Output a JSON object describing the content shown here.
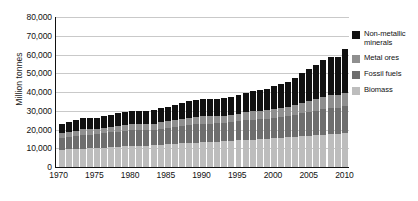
{
  "chart_data": {
    "type": "bar",
    "stacked": true,
    "title": "",
    "xlabel": "",
    "ylabel": "Million tonnes",
    "ylim": [
      0,
      80000
    ],
    "ytick_labels": [
      "80,000",
      "70,000",
      "60,000",
      "50,000",
      "40,000",
      "30,000",
      "20,000",
      "10,000",
      "0"
    ],
    "ytick_values": [
      80000,
      70000,
      60000,
      50000,
      40000,
      30000,
      20000,
      10000,
      0
    ],
    "xtick_labels": [
      "1970",
      "1975",
      "1980",
      "1985",
      "1990",
      "1995",
      "2000",
      "2005",
      "2010"
    ],
    "xtick_values": [
      1970,
      1975,
      1980,
      1985,
      1990,
      1995,
      2000,
      2005,
      2010
    ],
    "grid": true,
    "legend_position": "right",
    "x": [
      1970,
      1971,
      1972,
      1973,
      1974,
      1975,
      1976,
      1977,
      1978,
      1979,
      1980,
      1981,
      1982,
      1983,
      1984,
      1985,
      1986,
      1987,
      1988,
      1989,
      1990,
      1991,
      1992,
      1993,
      1994,
      1995,
      1996,
      1997,
      1998,
      1999,
      2000,
      2001,
      2002,
      2003,
      2004,
      2005,
      2006,
      2007,
      2008,
      2009,
      2010
    ],
    "series": [
      {
        "name": "Biomass",
        "color": "#bdbdbd",
        "values": [
          9200,
          9400,
          9550,
          9800,
          9900,
          10050,
          10300,
          10500,
          10750,
          10950,
          11100,
          11250,
          11450,
          11650,
          11900,
          12100,
          12350,
          12550,
          12800,
          13000,
          13200,
          13300,
          13500,
          13700,
          13950,
          14200,
          14450,
          14650,
          14850,
          15050,
          15300,
          15500,
          15750,
          16000,
          16300,
          16600,
          16900,
          17200,
          17500,
          17700,
          18000
        ]
      },
      {
        "name": "Fossil fuels",
        "color": "#6e6e6e",
        "values": [
          6400,
          6700,
          7000,
          7400,
          7400,
          7300,
          7700,
          7950,
          8150,
          8400,
          8400,
          8250,
          8200,
          8250,
          8600,
          8900,
          9100,
          9350,
          9650,
          9850,
          9900,
          9900,
          9850,
          9850,
          9950,
          10150,
          10450,
          10600,
          10700,
          10800,
          11100,
          11250,
          11400,
          11900,
          12400,
          12800,
          13200,
          13650,
          13950,
          13700,
          14300
        ]
      },
      {
        "name": "Metal ores",
        "color": "#8f8f8f",
        "values": [
          2600,
          2700,
          2800,
          2950,
          2950,
          2850,
          3000,
          3100,
          3150,
          3250,
          3250,
          3200,
          3150,
          3200,
          3350,
          3450,
          3550,
          3650,
          3800,
          3900,
          3950,
          3900,
          3850,
          3850,
          3950,
          4100,
          4250,
          4400,
          4450,
          4550,
          4750,
          4850,
          5000,
          5350,
          5700,
          6000,
          6350,
          6700,
          6950,
          6800,
          7400
        ]
      },
      {
        "name": "Non-metallic minerals",
        "color": "#111111",
        "values": [
          5000,
          5200,
          5500,
          5900,
          5850,
          5800,
          6150,
          6450,
          6700,
          6950,
          7000,
          6950,
          6900,
          7050,
          7450,
          7750,
          8100,
          8500,
          8900,
          9150,
          9250,
          9150,
          9100,
          9200,
          9500,
          9900,
          10350,
          10750,
          11000,
          11400,
          12000,
          12500,
          13200,
          14400,
          15700,
          16900,
          18200,
          19500,
          20300,
          20600,
          23000
        ]
      }
    ],
    "totals": [
      23200,
      24000,
      24850,
      26050,
      26100,
      26000,
      27150,
      28000,
      28750,
      29550,
      29750,
      29650,
      29700,
      30150,
      31300,
      32200,
      33100,
      34050,
      35150,
      35900,
      36300,
      36250,
      36300,
      36600,
      37350,
      38350,
      39500,
      40400,
      41000,
      41800,
      43150,
      44100,
      45350,
      47650,
      50100,
      52300,
      54650,
      57050,
      58700,
      58800,
      62700
    ]
  },
  "legend": {
    "items": [
      {
        "label": "Non-metallic minerals",
        "color": "#111111"
      },
      {
        "label": "Metal ores",
        "color": "#8f8f8f"
      },
      {
        "label": "Fossil fuels",
        "color": "#6e6e6e"
      },
      {
        "label": "Biomass",
        "color": "#bdbdbd"
      }
    ]
  },
  "axes": {
    "y_title": "Million tonnes"
  }
}
